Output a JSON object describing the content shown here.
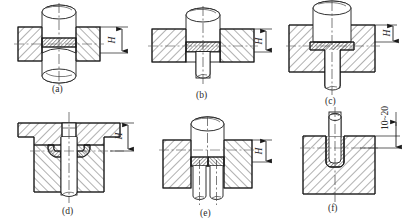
{
  "figure": {
    "title": "",
    "type": "engineering-cross-section-drawing",
    "panel_count": 6,
    "line_color": "#1a1a1a",
    "hatch_color": "#3a3a3a",
    "fill_color": "#ffffff",
    "dense_fill_color": "#555555"
  },
  "panels": [
    {
      "id": "a",
      "caption": "(a)",
      "dimension_label": "H",
      "description": "through rivet in plate, upset head both sides"
    },
    {
      "id": "b",
      "caption": "(b)",
      "dimension_label": "H",
      "description": "rivet head seated in counterbore, shank protruding below"
    },
    {
      "id": "c",
      "caption": "(c)",
      "dimension_label": "H",
      "description": "flanged rivet head recessed in deep bore"
    },
    {
      "id": "d",
      "caption": "(d)",
      "dimension_label": "H",
      "description": "two curved rivets in stepped body, central pin"
    },
    {
      "id": "e",
      "caption": "(e)",
      "dimension_label": "H",
      "description": "twin parallel pins in single block"
    },
    {
      "id": "f",
      "caption": "(f)",
      "dimension_label": "10~20",
      "description": "blind hole pin seated in block"
    }
  ],
  "dimension_labels": {
    "h": "H",
    "range": "10~20"
  }
}
